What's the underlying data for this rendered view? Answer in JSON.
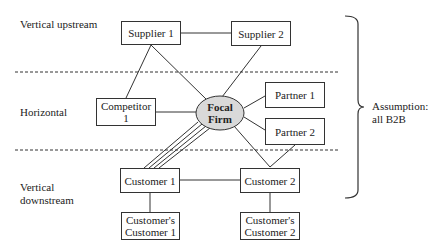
{
  "layers": {
    "upstream": "Vertical upstream",
    "horizontal": "Horizontal",
    "downstream": "Vertical downstream"
  },
  "nodes": {
    "supplier1": "Supplier 1",
    "supplier2": "Supplier 2",
    "competitor1": "Competitor 1",
    "focal": "Focal Firm",
    "partner1": "Partner 1",
    "partner2": "Partner 2",
    "customer1": "Customer 1",
    "customer2": "Customer 2",
    "cc1": "Customer's Customer 1",
    "cc2": "Customer's Customer 2"
  },
  "annotation": "Assumption: all B2B",
  "colors": {
    "focal_fill": "#d9d9d9",
    "line": "#333333"
  }
}
